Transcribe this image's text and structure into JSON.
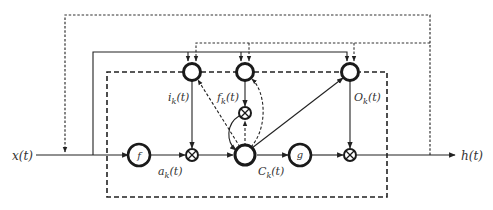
{
  "diagram": {
    "type": "LSTM cell block diagram",
    "input_label": "x(t)",
    "output_label": "h(t)",
    "nodes": {
      "input_activation": "f",
      "output_activation": "g",
      "input_gate": {
        "label": "i",
        "sub": "k",
        "arg": "(t)"
      },
      "forget_gate": {
        "label": "f",
        "sub": "k",
        "arg": "(t)"
      },
      "output_gate": {
        "label": "O",
        "sub": "k",
        "arg": "(t)"
      },
      "candidate": {
        "label": "a",
        "sub": "k",
        "arg": "(t)"
      },
      "cell_state": {
        "label": "C",
        "sub": "k",
        "arg": "(t)"
      },
      "multiply_symbol": "⊗"
    },
    "colors": {
      "stroke": "#222222",
      "text": "#333333",
      "background": "#ffffff"
    }
  }
}
